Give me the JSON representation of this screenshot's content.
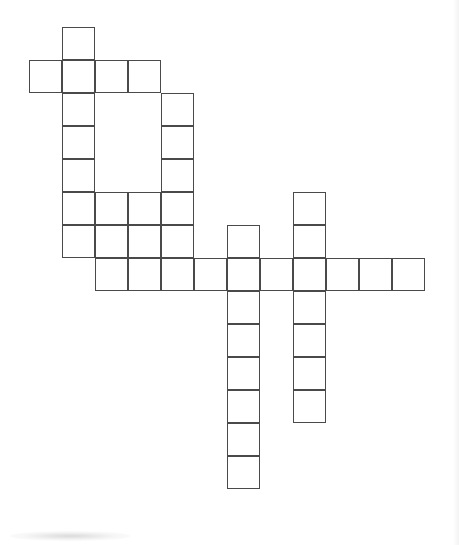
{
  "document": {
    "type": "crossword-grid",
    "title": "Crossword Puzzle Grid",
    "background_color": "#ffffff",
    "cell_border_color": "#4a4a4a",
    "cell_fill_color": "#ffffff"
  },
  "grid": {
    "cell_size": 33,
    "origin_x": 29,
    "origin_y": 27,
    "columns": 13,
    "rows": 15,
    "border_width": 1.6,
    "total_cells": 56,
    "cells": [
      {
        "row": 0,
        "col": 1,
        "letter": ""
      },
      {
        "row": 1,
        "col": 0,
        "letter": ""
      },
      {
        "row": 1,
        "col": 1,
        "letter": ""
      },
      {
        "row": 1,
        "col": 2,
        "letter": ""
      },
      {
        "row": 1,
        "col": 3,
        "letter": ""
      },
      {
        "row": 2,
        "col": 1,
        "letter": ""
      },
      {
        "row": 2,
        "col": 4,
        "letter": ""
      },
      {
        "row": 3,
        "col": 1,
        "letter": ""
      },
      {
        "row": 3,
        "col": 4,
        "letter": ""
      },
      {
        "row": 4,
        "col": 1,
        "letter": ""
      },
      {
        "row": 4,
        "col": 4,
        "letter": ""
      },
      {
        "row": 5,
        "col": 1,
        "letter": ""
      },
      {
        "row": 5,
        "col": 2,
        "letter": ""
      },
      {
        "row": 5,
        "col": 3,
        "letter": ""
      },
      {
        "row": 5,
        "col": 4,
        "letter": ""
      },
      {
        "row": 5,
        "col": 8,
        "letter": ""
      },
      {
        "row": 6,
        "col": 1,
        "letter": ""
      },
      {
        "row": 6,
        "col": 2,
        "letter": ""
      },
      {
        "row": 6,
        "col": 3,
        "letter": ""
      },
      {
        "row": 6,
        "col": 4,
        "letter": ""
      },
      {
        "row": 6,
        "col": 6,
        "letter": ""
      },
      {
        "row": 6,
        "col": 8,
        "letter": ""
      },
      {
        "row": 7,
        "col": 2,
        "letter": ""
      },
      {
        "row": 7,
        "col": 3,
        "letter": ""
      },
      {
        "row": 7,
        "col": 4,
        "letter": ""
      },
      {
        "row": 7,
        "col": 5,
        "letter": ""
      },
      {
        "row": 7,
        "col": 6,
        "letter": ""
      },
      {
        "row": 7,
        "col": 7,
        "letter": ""
      },
      {
        "row": 7,
        "col": 8,
        "letter": ""
      },
      {
        "row": 7,
        "col": 9,
        "letter": ""
      },
      {
        "row": 7,
        "col": 10,
        "letter": ""
      },
      {
        "row": 7,
        "col": 11,
        "letter": ""
      },
      {
        "row": 8,
        "col": 6,
        "letter": ""
      },
      {
        "row": 8,
        "col": 8,
        "letter": ""
      },
      {
        "row": 9,
        "col": 6,
        "letter": ""
      },
      {
        "row": 9,
        "col": 8,
        "letter": ""
      },
      {
        "row": 10,
        "col": 6,
        "letter": ""
      },
      {
        "row": 10,
        "col": 8,
        "letter": ""
      },
      {
        "row": 11,
        "col": 6,
        "letter": ""
      },
      {
        "row": 11,
        "col": 8,
        "letter": ""
      },
      {
        "row": 12,
        "col": 6,
        "letter": ""
      },
      {
        "row": 13,
        "col": 6,
        "letter": ""
      }
    ]
  },
  "entries": {
    "across": [
      {
        "id": "a1",
        "row": 1,
        "start_col": 0,
        "length": 4
      },
      {
        "id": "a2",
        "row": 5,
        "start_col": 1,
        "length": 4
      },
      {
        "id": "a3",
        "row": 6,
        "start_col": 1,
        "length": 4
      },
      {
        "id": "a4",
        "row": 7,
        "start_col": 2,
        "length": 10
      }
    ],
    "down": [
      {
        "id": "d1",
        "col": 1,
        "start_row": 0,
        "length": 7
      },
      {
        "id": "d2",
        "col": 4,
        "start_row": 2,
        "length": 5
      },
      {
        "id": "d3",
        "col": 6,
        "start_row": 6,
        "length": 8
      },
      {
        "id": "d4",
        "col": 8,
        "start_row": 5,
        "length": 7
      }
    ]
  }
}
